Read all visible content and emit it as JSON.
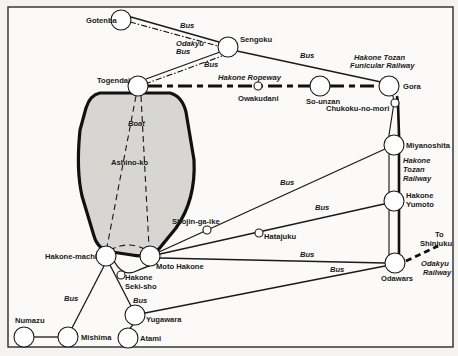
{
  "map": {
    "title": "Hakone area transport map",
    "lake": {
      "name": "Ashino-ko",
      "boat_label": "Boat"
    },
    "stations": [
      {
        "id": "gotenba",
        "label": "Gotenba",
        "x": 121,
        "y": 20,
        "r": 10
      },
      {
        "id": "sengoku",
        "label": "Sengoku",
        "x": 228,
        "y": 47,
        "r": 10
      },
      {
        "id": "togendai",
        "label": "Togendai",
        "x": 138,
        "y": 86,
        "r": 10
      },
      {
        "id": "owakudani",
        "label": "Owakudani",
        "x": 258,
        "y": 86,
        "r": 4
      },
      {
        "id": "so-unzan",
        "label": "So-unzan",
        "x": 320,
        "y": 86,
        "r": 10
      },
      {
        "id": "gora",
        "label": "Gora",
        "x": 389,
        "y": 86,
        "r": 10
      },
      {
        "id": "chukoku-no-mori",
        "label": "Chukoku-no-mori",
        "x": 395,
        "y": 103,
        "r": 4
      },
      {
        "id": "miyanoshita",
        "label": "Miyanoshita",
        "x": 394,
        "y": 145,
        "r": 10
      },
      {
        "id": "shojin-ga-ike",
        "label": "Shojin-ga-ike",
        "x": 207,
        "y": 230,
        "r": 4
      },
      {
        "id": "hatajuku",
        "label": "Hatajuku",
        "x": 259,
        "y": 233,
        "r": 4
      },
      {
        "id": "hakone-yumoto",
        "label": "Hakone\nYumoto",
        "x": 394,
        "y": 201,
        "r": 10
      },
      {
        "id": "hakone-machi",
        "label": "Hakone-machi",
        "x": 106,
        "y": 256,
        "r": 10
      },
      {
        "id": "moto-hakone",
        "label": "Moto Hakone",
        "x": 150,
        "y": 256,
        "r": 10
      },
      {
        "id": "hakone-seki-sho",
        "label": "Hakone\nSeki-sho",
        "x": 121,
        "y": 275,
        "r": 4
      },
      {
        "id": "odawara",
        "label": "Odawars",
        "x": 395,
        "y": 263,
        "r": 10
      },
      {
        "id": "yugawara",
        "label": "Yugawara",
        "x": 135,
        "y": 315,
        "r": 10
      },
      {
        "id": "atami",
        "label": "Atami",
        "x": 128,
        "y": 338,
        "r": 10
      },
      {
        "id": "numazu",
        "label": "Numazu",
        "x": 24,
        "y": 337,
        "r": 10
      },
      {
        "id": "mishima",
        "label": "Mishima",
        "x": 68,
        "y": 337,
        "r": 10
      }
    ],
    "route_labels": {
      "bus_gotenba_sengoku": "Bus",
      "odakyu_bus": "Odakyu\nBus",
      "bus_togendai_sengoku": "Bus",
      "bus_sengoku_gora": "Bus",
      "hakone_ropeway": "Hakone Ropeway",
      "funicular": "Hakone Tozan\nFunicular Railway",
      "tozan_railway": "Hakone\nTozan\nRailway",
      "bus_miyanoshita": "Bus",
      "bus_yumoto": "Bus",
      "bus_odawara_moto": "Bus",
      "bus_odawara_yugawara": "Bus",
      "bus_mishima": "Bus",
      "bus_yugawara": "Bus",
      "to_shinjuku": "To\nShinjuku",
      "odakyu_railway": "Odakyu\nRailway"
    }
  }
}
